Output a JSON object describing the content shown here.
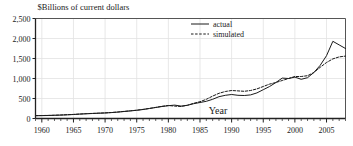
{
  "chart_data": {
    "type": "line",
    "title": "",
    "ylabel": "$Billions of current dollars",
    "xlabel": "Year",
    "xlim": [
      1959,
      2008
    ],
    "ylim": [
      0,
      2500
    ],
    "grid": true,
    "legend_position": "top-center",
    "y_ticks": [
      0,
      500,
      1000,
      1500,
      2000,
      2500
    ],
    "y_tick_labels": [
      "0",
      "500",
      "1,000",
      "1,500",
      "2,000",
      "2,500"
    ],
    "x_ticks": [
      1960,
      1965,
      1970,
      1975,
      1980,
      1985,
      1990,
      1995,
      2000,
      2005
    ],
    "x_tick_labels": [
      "1960",
      "1965",
      "1970",
      "1975",
      "1980",
      "1985",
      "1990",
      "1995",
      "2000",
      "2005"
    ],
    "x_minor_tick_step": 1,
    "x": [
      1959,
      1960,
      1961,
      1962,
      1963,
      1964,
      1965,
      1966,
      1967,
      1968,
      1969,
      1970,
      1971,
      1972,
      1973,
      1974,
      1975,
      1976,
      1977,
      1978,
      1979,
      1980,
      1981,
      1982,
      1983,
      1984,
      1985,
      1986,
      1987,
      1988,
      1989,
      1990,
      1991,
      1992,
      1993,
      1994,
      1995,
      1996,
      1997,
      1998,
      1999,
      2000,
      2001,
      2002,
      2003,
      2004,
      2005,
      2006,
      2007,
      2008
    ],
    "series": [
      {
        "name": "actual",
        "style": "solid",
        "color": "#1a1a1a",
        "values": [
          70,
          72,
          75,
          80,
          85,
          92,
          100,
          110,
          118,
          125,
          132,
          138,
          148,
          160,
          175,
          190,
          205,
          225,
          250,
          275,
          300,
          320,
          335,
          310,
          330,
          370,
          400,
          430,
          480,
          545,
          580,
          600,
          580,
          575,
          590,
          640,
          720,
          800,
          900,
          1010,
          1000,
          1035,
          980,
          1020,
          1150,
          1330,
          1570,
          1930,
          1840,
          1750
        ]
      },
      {
        "name": "simulated",
        "style": "dashed",
        "color": "#1a1a1a",
        "values": [
          72,
          74,
          78,
          82,
          88,
          95,
          102,
          112,
          120,
          128,
          134,
          140,
          150,
          162,
          178,
          192,
          208,
          228,
          252,
          278,
          305,
          325,
          310,
          300,
          330,
          380,
          420,
          480,
          560,
          630,
          675,
          700,
          690,
          680,
          700,
          740,
          800,
          860,
          900,
          950,
          1000,
          1050,
          1050,
          1070,
          1150,
          1280,
          1400,
          1490,
          1540,
          1560
        ]
      }
    ]
  },
  "legend": {
    "entries": [
      {
        "label": "actual",
        "style": "solid"
      },
      {
        "label": "simulated",
        "style": "dashed"
      }
    ]
  }
}
